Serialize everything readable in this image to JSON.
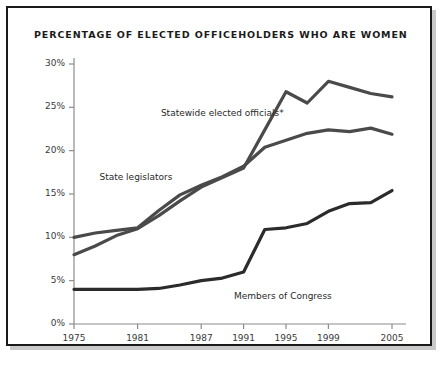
{
  "chart_data": {
    "type": "line",
    "title": "PERCENTAGE OF ELECTED OFFICEHOLDERS WHO ARE WOMEN",
    "xlabel": "",
    "ylabel": "",
    "xlim": [
      1975,
      2005
    ],
    "ylim": [
      0,
      30
    ],
    "grid": false,
    "legend_position": "inline-annotations",
    "x_tick_labels": [
      "1975",
      "1981",
      "1987",
      "1991",
      "1995",
      "1999",
      "2005"
    ],
    "x_ticks": [
      1975,
      1981,
      1987,
      1991,
      1995,
      1999,
      2005
    ],
    "y_tick_labels": [
      "0%",
      "5%",
      "10%",
      "15%",
      "20%",
      "25%",
      "30%"
    ],
    "y_ticks": [
      0,
      5,
      10,
      15,
      20,
      25,
      30
    ],
    "series": [
      {
        "name": "Statewide elected officials*",
        "color": "#4a4a4a",
        "label_x": 1983.2,
        "label_y": 24.2,
        "x": [
          1975,
          1977,
          1979,
          1981,
          1983,
          1985,
          1987,
          1989,
          1991,
          1993,
          1995,
          1997,
          1999,
          2001,
          2003,
          2005
        ],
        "y": [
          8.0,
          9.0,
          10.2,
          11.0,
          12.5,
          14.2,
          15.8,
          16.9,
          18.0,
          22.4,
          26.8,
          25.5,
          28.0,
          27.3,
          26.6,
          26.2
        ]
      },
      {
        "name": "State legislators",
        "color": "#4a4a4a",
        "label_x": 1977.4,
        "label_y": 16.8,
        "x": [
          1975,
          1977,
          1979,
          1981,
          1983,
          1985,
          1987,
          1989,
          1991,
          1993,
          1995,
          1997,
          1999,
          2001,
          2003,
          2005
        ],
        "y": [
          10.0,
          10.5,
          10.8,
          11.1,
          13.1,
          14.9,
          16.0,
          17.0,
          18.2,
          20.4,
          21.2,
          22.0,
          22.4,
          22.2,
          22.6,
          21.9
        ]
      },
      {
        "name": "Members of Congress",
        "color": "#2b2b2b",
        "label_x": 1990.1,
        "label_y": 3.1,
        "x": [
          1975,
          1977,
          1979,
          1981,
          1983,
          1985,
          1987,
          1989,
          1991,
          1993,
          1995,
          1997,
          1999,
          2001,
          2003,
          2005
        ],
        "y": [
          4.0,
          4.0,
          4.0,
          4.0,
          4.1,
          4.5,
          5.0,
          5.3,
          6.0,
          10.9,
          11.1,
          11.6,
          13.0,
          13.9,
          14.0,
          15.4
        ]
      }
    ]
  }
}
